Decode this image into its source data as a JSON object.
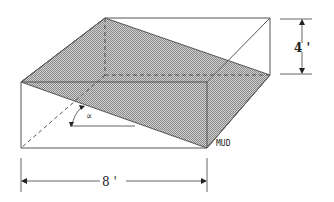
{
  "diagram": {
    "labels": {
      "height": "4 '",
      "length": "8 '",
      "angle": "∝",
      "material": "MUD"
    },
    "colors": {
      "edge": "#555555",
      "shade": "#b8b8b8",
      "text": "#222222"
    }
  }
}
